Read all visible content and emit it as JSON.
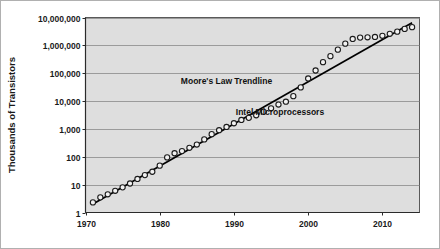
{
  "chart_data": {
    "type": "scatter",
    "title": "",
    "xlabel": "",
    "ylabel": "Thousands of Transistors",
    "xlim": [
      1970,
      2015
    ],
    "ylim": [
      1,
      10000000
    ],
    "yscale": "log",
    "grid": true,
    "legend": "none",
    "xticks": [
      "1970",
      "1980",
      "1990",
      "2000",
      "2010"
    ],
    "xtick_values": [
      1970,
      1980,
      1990,
      2000,
      2010
    ],
    "yticks": [
      "1",
      "10",
      "100",
      "1,000",
      "10,000",
      "100,000",
      "1,000,000",
      "10,000,000"
    ],
    "ytick_values": [
      1,
      10,
      100,
      1000,
      10000,
      100000,
      1000000,
      10000000
    ],
    "annotations": [
      {
        "text": "Moore's Law Trendline",
        "x": 1989.0,
        "y": 42000
      },
      {
        "text": "Intel Microprocessors",
        "x": 1996.2,
        "y": 3100
      }
    ],
    "series": [
      {
        "name": "Intel Microprocessors",
        "marker": "open-circle",
        "x": [
          1971,
          1972,
          1973,
          1974,
          1975,
          1976,
          1977,
          1978,
          1979,
          1980,
          1981,
          1982,
          1983,
          1984,
          1985,
          1986,
          1987,
          1988,
          1989,
          1990,
          1991,
          1992,
          1993,
          1994,
          1995,
          1996,
          1997,
          1998,
          1999,
          2000,
          2001,
          2002,
          2003,
          2004,
          2005,
          2006,
          2007,
          2008,
          2009,
          2010,
          2011,
          2012,
          2013,
          2014
        ],
        "y": [
          2.3,
          3.5,
          4.5,
          6.0,
          8.0,
          11.0,
          16.0,
          22.0,
          29.0,
          48.0,
          95.0,
          134.0,
          160.0,
          210.0,
          275.0,
          420.0,
          650.0,
          900.0,
          1180.0,
          1600.0,
          2100.0,
          2500.0,
          3100.0,
          4100.0,
          5500.0,
          7500.0,
          9500.0,
          15000.0,
          31000.0,
          65000.0,
          125000.0,
          250000.0,
          410000.0,
          700000.0,
          1150000.0,
          1700000.0,
          1900000.0,
          1950000.0,
          2000000.0,
          2200000.0,
          2600000.0,
          3100000.0,
          3900000.0,
          4500000.0
        ]
      },
      {
        "name": "Moore's Law Trendline",
        "marker": "none",
        "type": "line",
        "x": [
          1971,
          2014
        ],
        "y": [
          2.0,
          6500000.0
        ]
      }
    ]
  },
  "axis_titles": {
    "y": "Thousands of Transistors"
  }
}
